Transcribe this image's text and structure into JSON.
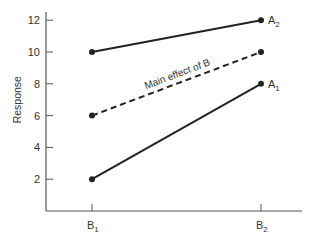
{
  "chart_data": {
    "type": "line",
    "title": "",
    "xlabel": "",
    "ylabel": "Response",
    "categories": [
      "B1",
      "B2"
    ],
    "category_labels": [
      {
        "base": "B",
        "sub": "1"
      },
      {
        "base": "B",
        "sub": "2"
      }
    ],
    "yticks": [
      2,
      4,
      6,
      8,
      10,
      12
    ],
    "ylim": [
      0,
      13
    ],
    "grid": false,
    "legend": "none (direct line labels)",
    "series": [
      {
        "name": "A2",
        "label_base": "A",
        "label_sub": "2",
        "values": [
          10,
          12
        ],
        "style": "solid",
        "color": "#222222"
      },
      {
        "name": "Main effect of B",
        "values": [
          6,
          10
        ],
        "style": "dashed",
        "color": "#222222"
      },
      {
        "name": "A1",
        "label_base": "A",
        "label_sub": "1",
        "values": [
          2,
          8
        ],
        "style": "solid",
        "color": "#222222"
      }
    ],
    "annotations": [
      {
        "text": "Main effect of B",
        "along_series": "Main effect of B"
      }
    ]
  }
}
